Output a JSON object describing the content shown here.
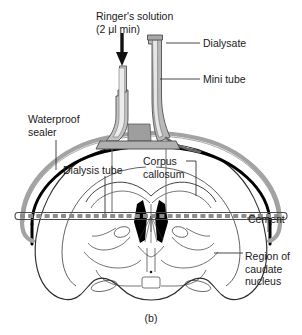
{
  "figure": {
    "caption": "(b)"
  },
  "labels": {
    "ringer_line1": "Ringer's solution",
    "ringer_line2": "(2 μl min)",
    "dialysate": "Dialysate",
    "mini_tube": "Mini tube",
    "waterproof_line1": "Waterproof",
    "waterproof_line2": "sealer",
    "dialysis_tube": "Dialysis tube",
    "corpus_line1": "Corpus",
    "corpus_line2": "callosum",
    "cement": "Cement",
    "region_line1": "Region of",
    "region_line2": "caudate",
    "region_line3": "nucleus"
  },
  "colors": {
    "ink": "#1a1a1a",
    "outline": "#000000",
    "brain_line": "#3a3a3a",
    "tube_fill": "#b5b5b5",
    "tube_fill_light": "#d2d2d2",
    "cement_black": "#000000",
    "sealer_gray": "#9a9a9a",
    "dash_gray": "#8c8c8c",
    "background": "#ffffff"
  },
  "icons": {
    "flow_arrow": "down-arrow-icon"
  }
}
